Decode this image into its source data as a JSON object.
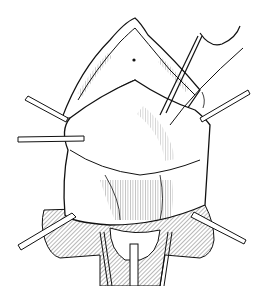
{
  "figure": {
    "kind": "surgical line illustration",
    "background": "#ffffff",
    "ink": "#111111",
    "elements": [
      {
        "name": "retractor-upper-left"
      },
      {
        "name": "retractor-left"
      },
      {
        "name": "retractor-upper-right"
      },
      {
        "name": "retractor-lower-left"
      },
      {
        "name": "retractor-lower-right"
      },
      {
        "name": "forceps"
      },
      {
        "name": "suture-thread"
      },
      {
        "name": "drape"
      },
      {
        "name": "catheter"
      }
    ]
  }
}
